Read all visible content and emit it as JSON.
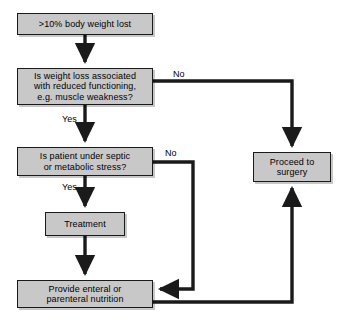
{
  "diagram": {
    "background_color": "#ffffff",
    "node_fill_color": "#c8c8c8",
    "node_border_color": "#1a1a1a",
    "connector_color": "#1a1a1a",
    "nodes": [
      {
        "id": "weight-loss",
        "text": ">10% body weight lost",
        "x": 17,
        "y": 13,
        "width": 136,
        "height": 22
      },
      {
        "id": "reduced-functioning",
        "text": "Is weight loss associated\nwith reduced functioning,\ne.g. muscle weakness?",
        "x": 17,
        "y": 68,
        "width": 136,
        "height": 37
      },
      {
        "id": "septic-stress",
        "text": "Is patient under septic\nor metabolic stress?",
        "x": 17,
        "y": 147,
        "width": 136,
        "height": 29
      },
      {
        "id": "treatment",
        "text": "Treatment",
        "x": 45,
        "y": 212,
        "width": 80,
        "height": 24
      },
      {
        "id": "nutrition",
        "text": "Provide enteral or\nparenteral nutrition",
        "x": 17,
        "y": 280,
        "width": 136,
        "height": 28
      },
      {
        "id": "surgery",
        "text": "Proceed to\nsurgery",
        "x": 253,
        "y": 152,
        "width": 78,
        "height": 30
      }
    ],
    "edge_labels": [
      {
        "id": "no-functioning",
        "text": "No",
        "x": 173,
        "y": 69
      },
      {
        "id": "yes-functioning",
        "text": "Yes",
        "x": 62,
        "y": 114
      },
      {
        "id": "no-septic",
        "text": "No",
        "x": 165,
        "y": 148
      },
      {
        "id": "yes-septic",
        "text": "Yes",
        "x": 62,
        "y": 182
      }
    ],
    "edges": [
      {
        "id": "weight-loss-to-functioning",
        "from": "weight-loss",
        "to": "reduced-functioning",
        "label": ""
      },
      {
        "id": "functioning-no-to-surgery",
        "from": "reduced-functioning",
        "to": "surgery",
        "label": "No"
      },
      {
        "id": "functioning-yes-to-septic",
        "from": "reduced-functioning",
        "to": "septic-stress",
        "label": "Yes"
      },
      {
        "id": "septic-no-to-nutrition",
        "from": "septic-stress",
        "to": "nutrition",
        "label": "No"
      },
      {
        "id": "septic-yes-to-treatment",
        "from": "septic-stress",
        "to": "treatment",
        "label": "Yes"
      },
      {
        "id": "treatment-to-nutrition",
        "from": "treatment",
        "to": "nutrition",
        "label": ""
      },
      {
        "id": "nutrition-to-surgery",
        "from": "nutrition",
        "to": "surgery",
        "label": ""
      }
    ]
  }
}
